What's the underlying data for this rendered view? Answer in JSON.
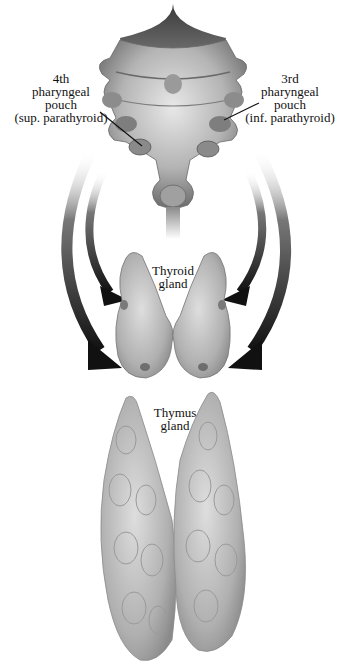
{
  "diagram": {
    "title": "",
    "colors": {
      "background": "#ffffff",
      "tissue_light": "#d9d9d9",
      "tissue_mid": "#a8a8a8",
      "tissue_dark": "#555555",
      "arrow": "#1a1a1a",
      "text": "#111111"
    },
    "structures": [
      {
        "id": "pharyngeal-arches",
        "description": "pharyngeal region with pouches"
      },
      {
        "id": "thyroid-gland",
        "description": "bilobed thyroid gland"
      },
      {
        "id": "thymus-gland",
        "description": "bilobed thymus gland"
      }
    ],
    "labels": {
      "fourth_pouch": {
        "line1": "4th",
        "line2": "pharyngeal",
        "line3": "pouch",
        "line4": "(sup. parathyroid)"
      },
      "third_pouch": {
        "line1": "3rd",
        "line2": "pharyngeal",
        "line3": "pouch",
        "line4": "(inf. parathyroid)"
      },
      "thyroid": {
        "line1": "Thyroid",
        "line2": "gland"
      },
      "thymus": {
        "line1": "Thymus",
        "line2": "gland"
      }
    },
    "arrows": [
      {
        "id": "left-outer-arrow",
        "from": "pharyngeal-region",
        "to": "thymus-gland",
        "side": "left"
      },
      {
        "id": "left-inner-arrow",
        "from": "pharyngeal-region",
        "to": "thyroid-gland",
        "side": "left"
      },
      {
        "id": "right-inner-arrow",
        "from": "pharyngeal-region",
        "to": "thyroid-gland",
        "side": "right"
      },
      {
        "id": "right-outer-arrow",
        "from": "pharyngeal-region",
        "to": "thymus-gland",
        "side": "right"
      }
    ]
  }
}
